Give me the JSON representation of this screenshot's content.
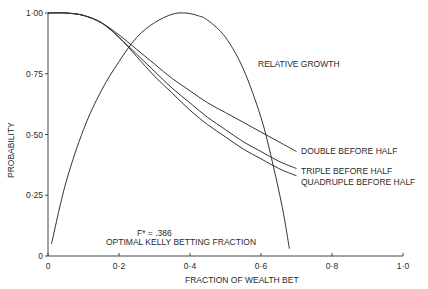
{
  "chart_data": {
    "type": "line",
    "title": "",
    "xlabel": "FRACTION OF WEALTH BET",
    "ylabel": "PROBABILITY",
    "xlim": [
      0,
      1.0
    ],
    "ylim": [
      0,
      1.0
    ],
    "grid": false,
    "x_ticks": [
      "0",
      "0·2",
      "0·4",
      "0·6",
      "0·8",
      "1·0"
    ],
    "x_tick_values": [
      0,
      0.2,
      0.4,
      0.6,
      0.8,
      1.0
    ],
    "y_ticks": [
      "0",
      "0·25",
      "0·50",
      "0·75",
      "1·00"
    ],
    "y_tick_values": [
      0,
      0.25,
      0.5,
      0.75,
      1.0
    ],
    "series": [
      {
        "name": "RELATIVE GROWTH",
        "x": [
          0.01,
          0.05,
          0.1,
          0.15,
          0.2,
          0.25,
          0.3,
          0.35,
          0.386,
          0.42,
          0.45,
          0.5,
          0.55,
          0.6,
          0.63,
          0.66,
          0.68
        ],
        "y": [
          0.05,
          0.3,
          0.52,
          0.68,
          0.8,
          0.9,
          0.96,
          0.995,
          1.0,
          0.99,
          0.97,
          0.9,
          0.77,
          0.57,
          0.4,
          0.2,
          0.03
        ]
      },
      {
        "name": "DOUBLE BEFORE HALF",
        "x": [
          0.0,
          0.05,
          0.1,
          0.15,
          0.2,
          0.25,
          0.3,
          0.35,
          0.4,
          0.45,
          0.5,
          0.55,
          0.6,
          0.65,
          0.7
        ],
        "y": [
          1.0,
          1.0,
          0.99,
          0.96,
          0.91,
          0.85,
          0.79,
          0.73,
          0.68,
          0.63,
          0.59,
          0.55,
          0.51,
          0.47,
          0.43
        ]
      },
      {
        "name": "TRIPLE BEFORE HALF",
        "x": [
          0.0,
          0.05,
          0.1,
          0.15,
          0.2,
          0.25,
          0.3,
          0.35,
          0.4,
          0.45,
          0.5,
          0.55,
          0.6,
          0.65,
          0.7
        ],
        "y": [
          1.0,
          1.0,
          0.99,
          0.96,
          0.9,
          0.83,
          0.76,
          0.69,
          0.63,
          0.57,
          0.52,
          0.47,
          0.43,
          0.39,
          0.36
        ]
      },
      {
        "name": "QUADRUPLE BEFORE HALF",
        "x": [
          0.0,
          0.05,
          0.1,
          0.15,
          0.2,
          0.25,
          0.3,
          0.35,
          0.4,
          0.45,
          0.5,
          0.55,
          0.6,
          0.65,
          0.7
        ],
        "y": [
          1.0,
          1.0,
          0.99,
          0.96,
          0.9,
          0.82,
          0.74,
          0.67,
          0.6,
          0.54,
          0.49,
          0.44,
          0.4,
          0.36,
          0.33
        ]
      }
    ],
    "annotations": [
      {
        "text": "RELATIVE GROWTH",
        "x": 0.59,
        "y": 0.8
      },
      {
        "text": "DOUBLE BEFORE HALF",
        "x": 0.7,
        "y": 0.43
      },
      {
        "text": "TRIPLE BEFORE HALF",
        "x": 0.7,
        "y": 0.36
      },
      {
        "text": "QUADRUPLE BEFORE HALF",
        "x": 0.7,
        "y": 0.32
      },
      {
        "text": "F* = .386",
        "x": 0.26,
        "y": 0.12
      },
      {
        "text": "OPTIMAL KELLY BETTING FRACTION",
        "x": 0.26,
        "y": 0.07
      }
    ],
    "legend": "none (inline labels)"
  },
  "labels": {
    "relative_growth": "RELATIVE GROWTH",
    "double": "DOUBLE BEFORE HALF",
    "triple": "TRIPLE BEFORE HALF",
    "quadruple": "QUADRUPLE BEFORE HALF",
    "fstar": "F* = .386",
    "kelly": "OPTIMAL KELLY BETTING FRACTION",
    "xlabel": "FRACTION OF WEALTH BET",
    "ylabel": "PROBABILITY"
  }
}
